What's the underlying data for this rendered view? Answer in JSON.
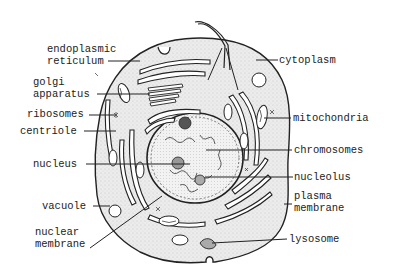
{
  "diagram": {
    "labels": {
      "endoplasmic_reticulum": "endoplasmic\nreticulum",
      "golgi_apparatus": "golgi\napparatus",
      "ribosomes": "ribosomes",
      "centriole": "centriole",
      "nucleus": "nucleus",
      "vacuole": "vacuole",
      "nuclear_membrane": "nuclear\nmembrane",
      "cytoplasm": "cytoplasm",
      "mitochondria": "mitochondria",
      "chromosomes": "chromosomes",
      "nucleolus": "nucleolus",
      "plasma_membrane": "plasma\nmembrane",
      "lysosome": "lysosome"
    },
    "colors": {
      "line": "#222222",
      "cytoplasm_fill": "#e9e9e9",
      "background": "#ffffff"
    }
  }
}
